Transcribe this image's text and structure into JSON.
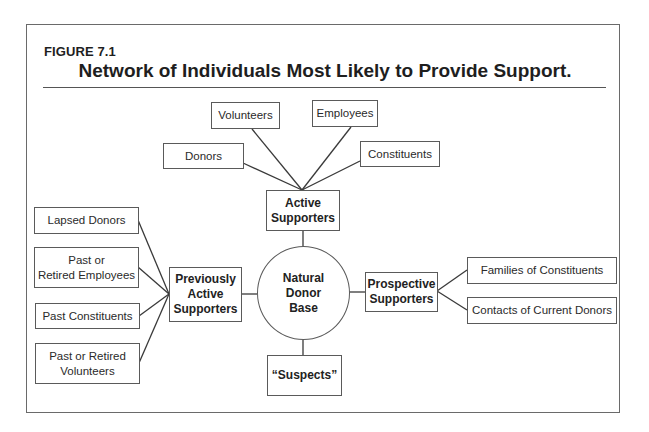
{
  "figure": {
    "label": "FIGURE 7.1",
    "title": "Network of Individuals Most Likely to Provide Support."
  },
  "center": {
    "label": "Natural\nDonor\nBase"
  },
  "groups": {
    "active": {
      "label": "Active\nSupporters",
      "children": [
        "Donors",
        "Volunteers",
        "Employees",
        "Constituents"
      ]
    },
    "previous": {
      "label": "Previously\nActive\nSupporters",
      "children": [
        "Lapsed Donors",
        "Past or\nRetired Employees",
        "Past Constituents",
        "Past or Retired\nVolunteers"
      ]
    },
    "prospective": {
      "label": "Prospective\nSupporters",
      "children": [
        "Families of Constituents",
        "Contacts of Current Donors"
      ]
    },
    "suspects": {
      "label": "“Suspects”"
    }
  },
  "colors": {
    "line": "#3a3a3a",
    "border": "#5a5a5a",
    "text": "#222222",
    "background": "#ffffff"
  }
}
